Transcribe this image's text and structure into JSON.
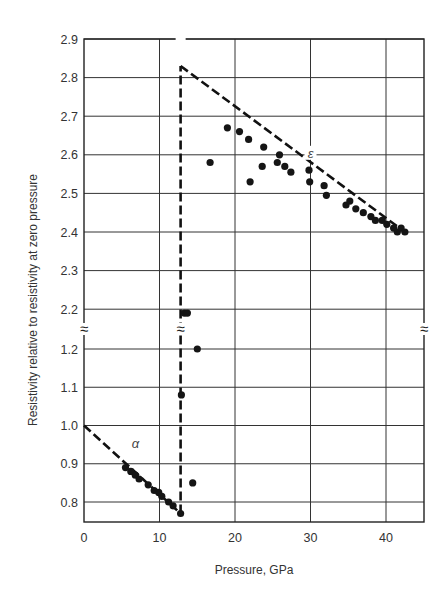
{
  "chart_data": {
    "type": "scatter",
    "title": "",
    "xlabel": "Pressure, GPa",
    "ylabel": "Resistivity relative to resistivity at zero pressure",
    "xlim": [
      0,
      45
    ],
    "x_ticks": [
      "0",
      "10",
      "20",
      "30",
      "40"
    ],
    "y_ticks_upper": [
      "2.9",
      "2.8",
      "2.7",
      "2.6",
      "2.5",
      "2.4",
      "2.3",
      "2.2"
    ],
    "y_ticks_lower": [
      "1.2",
      "1.1",
      "1.0",
      "0.9",
      "0.8"
    ],
    "ylim_upper": [
      2.2,
      2.9
    ],
    "ylim_lower": [
      0.75,
      1.2
    ],
    "axis_break": "between 1.2 and 2.2 (marked with ≈ on both y-axes and on the transition line)",
    "grid": true,
    "legend": null,
    "annotations": [
      {
        "text": "α",
        "x": 6.8,
        "y": 0.95,
        "meaning": "alpha phase"
      },
      {
        "text": "ε",
        "x": 30,
        "y": 2.6,
        "meaning": "epsilon phase"
      }
    ],
    "trend_lines": [
      {
        "name": "alpha dashed fit",
        "style": "dashed",
        "points": [
          [
            0,
            1.0
          ],
          [
            12.8,
            0.77
          ]
        ]
      },
      {
        "name": "transition dashed vertical",
        "style": "dashed",
        "points": [
          [
            12.8,
            0.77
          ],
          [
            12.8,
            2.83
          ]
        ]
      },
      {
        "name": "epsilon dashed fit",
        "style": "dashed",
        "points": [
          [
            12.8,
            2.83
          ],
          [
            42.5,
            2.4
          ]
        ]
      }
    ],
    "series": [
      {
        "name": "alpha phase",
        "x": [
          5.5,
          6.2,
          6.8,
          7.3,
          8.5,
          9.3,
          9.9,
          10.3,
          11.2,
          11.8,
          12.8
        ],
        "y": [
          0.89,
          0.88,
          0.87,
          0.86,
          0.845,
          0.83,
          0.825,
          0.815,
          0.8,
          0.79,
          0.77
        ]
      },
      {
        "name": "transition",
        "x": [
          12.9,
          13.3,
          13.7,
          15.0,
          14.4
        ],
        "y": [
          1.08,
          2.19,
          2.19,
          1.2,
          0.85
        ]
      },
      {
        "name": "epsilon phase",
        "x": [
          16.7,
          19.0,
          20.6,
          21.8,
          22.0,
          23.6,
          23.8,
          25.6,
          25.9,
          26.6,
          27.4,
          29.8,
          29.9,
          31.8,
          32.1,
          34.7,
          35.2,
          36.0,
          37.0,
          38.0,
          38.6,
          39.5,
          40.1,
          41.0,
          41.5,
          42.0,
          42.5
        ],
        "y": [
          2.58,
          2.67,
          2.66,
          2.64,
          2.53,
          2.57,
          2.62,
          2.58,
          2.6,
          2.57,
          2.555,
          2.56,
          2.53,
          2.52,
          2.495,
          2.47,
          2.48,
          2.46,
          2.45,
          2.44,
          2.43,
          2.43,
          2.42,
          2.41,
          2.4,
          2.41,
          2.4
        ]
      }
    ]
  }
}
